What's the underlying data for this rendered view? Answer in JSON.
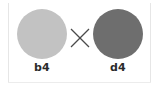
{
  "figure": {
    "type": "genetic-cross-panel",
    "background_color": "#ffffff",
    "frame_rule_color": "#e6e6e6",
    "cross_operator": "×",
    "cross_operator_color": "#4a4a4a",
    "specimens": [
      {
        "id": "left",
        "label": "b4",
        "shape": "circle",
        "fill_color": "#c2c2c2",
        "label_color": "#2b2b2b"
      },
      {
        "id": "right",
        "label": "d4",
        "shape": "circle",
        "fill_color": "#6e6e6e",
        "label_color": "#2b2b2b"
      }
    ]
  }
}
